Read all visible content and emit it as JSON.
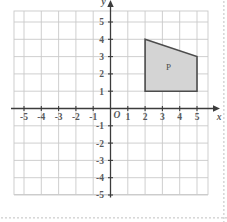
{
  "figure": {
    "background_color": "#ffffff"
  },
  "chart_data": {
    "type": "scatter",
    "title": "",
    "subtitle": "",
    "xlabel": "x",
    "ylabel": "y",
    "origin_label": "O",
    "xlim": [
      -5.6,
      5.6
    ],
    "ylim": [
      -5.6,
      5.6
    ],
    "grid": true,
    "grid_spacing": 1,
    "grid_color": "#c9c9c9",
    "axis_color": "#3c3c3c",
    "x_tick_labels": [
      "-5",
      "-4",
      "-3",
      "-2",
      "-1",
      "1",
      "2",
      "3",
      "4",
      "5"
    ],
    "x_tick_values": [
      -5,
      -4,
      -3,
      -2,
      -1,
      1,
      2,
      3,
      4,
      5
    ],
    "y_tick_labels": [
      "5",
      "4",
      "3",
      "2",
      "1",
      "-1",
      "-2",
      "-3",
      "-4",
      "-5"
    ],
    "y_tick_values": [
      5,
      4,
      3,
      2,
      1,
      -1,
      -2,
      -3,
      -4,
      -5
    ],
    "legend": null,
    "shapes": [
      {
        "name": "P",
        "label": "P",
        "label_position": [
          3.35,
          2.35
        ],
        "kind": "quadrilateral",
        "vertices": [
          [
            2,
            4
          ],
          [
            5,
            3
          ],
          [
            5,
            1
          ],
          [
            2,
            1
          ]
        ],
        "fill": "#d4d4d4",
        "stroke": "#4d4d4d",
        "stroke_width": 1.6
      }
    ]
  },
  "decoration": {
    "edge_dots_color": "#d8d8d8"
  }
}
